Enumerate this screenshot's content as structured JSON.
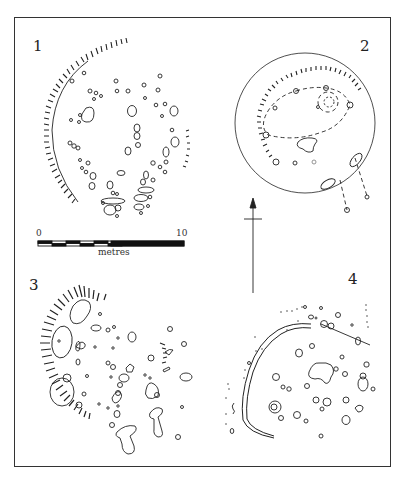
{
  "figure": {
    "plans": [
      {
        "id": "1",
        "label": "1"
      },
      {
        "id": "2",
        "label": "2"
      },
      {
        "id": "3",
        "label": "3"
      },
      {
        "id": "4",
        "label": "4"
      }
    ],
    "scale_bar": {
      "start_label": "0",
      "end_label": "10",
      "unit_label": "metres"
    },
    "north_arrow": {
      "direction": "up"
    }
  }
}
